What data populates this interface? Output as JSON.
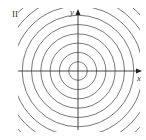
{
  "figure": {
    "panel_label": "II",
    "x_axis_label": "x",
    "y_axis_label": "y"
  },
  "diagram": {
    "center_px": [
      78,
      71
    ],
    "clip_box_px": {
      "x": 18,
      "y": 8,
      "width": 122,
      "height": 124
    },
    "circle_radii_px": [
      9.3,
      18.6,
      27.9,
      37.2,
      46.5,
      55.8,
      65.1,
      74.4,
      83.7
    ],
    "x_axis_px": {
      "x1": 18,
      "x2": 142,
      "y": 71
    },
    "y_axis_px": {
      "y1": 130,
      "y2": 9,
      "x": 78
    },
    "colors": {
      "curve": "#555555",
      "axis": "#333333",
      "background": "#ffffff"
    }
  }
}
